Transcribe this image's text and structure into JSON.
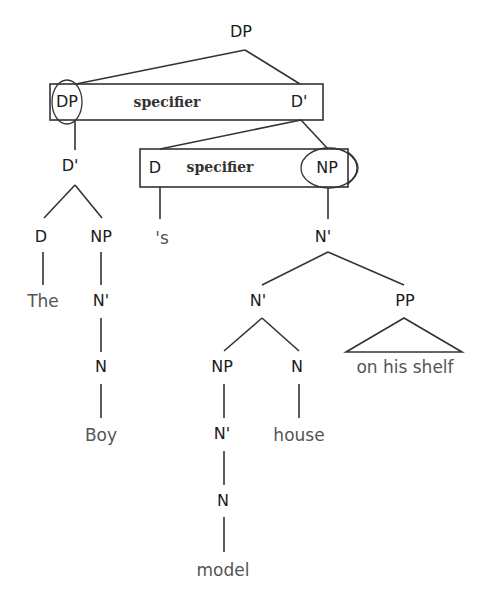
{
  "diagram": {
    "type": "syntax-tree",
    "colors": {
      "line": "#333333",
      "category_text": "#1a1a1a",
      "word_text": "#555555",
      "background": "#ffffff"
    },
    "root": {
      "label": "DP"
    },
    "boxes": [
      {
        "id": "box-upper",
        "left_label": "DP",
        "middle_label": "specifier",
        "right_label": "D'"
      },
      {
        "id": "box-lower",
        "left_label": "D",
        "middle_label": "specifier",
        "right_label": "NP"
      }
    ],
    "nodes": {
      "dp_root": "DP",
      "dp_spec": "DP",
      "d_bar_top": "D'",
      "d_bar_left": "D'",
      "d_left": "D",
      "np_left": "NP",
      "the": "The",
      "n_bar_left": "N'",
      "n_left": "N",
      "boy": "Boy",
      "d_poss": "D",
      "poss_s": "'s",
      "np_right": "NP",
      "n_bar_r1": "N'",
      "n_bar_r2": "N'",
      "pp": "PP",
      "on_his_shelf": "on his shelf",
      "np_model": "NP",
      "n_house": "N",
      "house": "house",
      "n_bar_model": "N'",
      "n_model": "N",
      "model": "model"
    }
  }
}
